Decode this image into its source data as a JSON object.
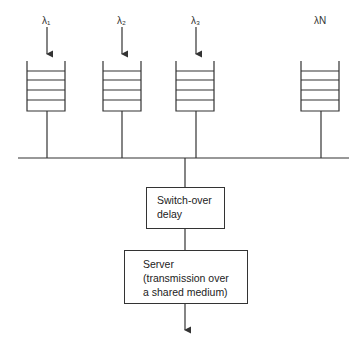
{
  "diagram": {
    "queues": [
      {
        "label": "λ₁",
        "id": "1",
        "has_arrow": true
      },
      {
        "label": "λ₂",
        "id": "2",
        "has_arrow": true
      },
      {
        "label": "λ₃",
        "id": "3",
        "has_arrow": true
      },
      {
        "label": "λN",
        "id": "N",
        "has_arrow": false
      }
    ],
    "switch_over": {
      "line1": "Switch-over",
      "line2": "delay"
    },
    "server": {
      "line1": "Server",
      "line2": "(transmission over",
      "line3": "a shared medium)"
    },
    "colors": {
      "stroke": "#333333",
      "background": "#ffffff"
    }
  }
}
